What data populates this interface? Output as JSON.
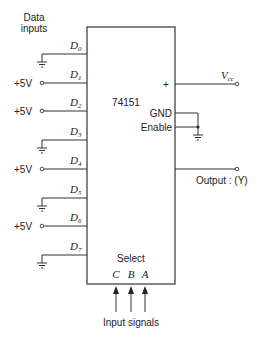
{
  "diagram": {
    "title_lines": [
      "Data",
      "inputs"
    ],
    "chip": {
      "part_number": "74151",
      "plus_label": "+",
      "gnd_label": "GND",
      "enable_label": "Enable",
      "select_label": "Select",
      "select_pins": [
        "C",
        "B",
        "A"
      ]
    },
    "data_inputs": [
      {
        "name": "D",
        "index": "0",
        "connection": "ground",
        "source_label": ""
      },
      {
        "name": "D",
        "index": "1",
        "connection": "+5V",
        "source_label": "+5V"
      },
      {
        "name": "D",
        "index": "2",
        "connection": "+5V",
        "source_label": "+5V"
      },
      {
        "name": "D",
        "index": "3",
        "connection": "ground",
        "source_label": ""
      },
      {
        "name": "D",
        "index": "4",
        "connection": "+5V",
        "source_label": "+5V"
      },
      {
        "name": "D",
        "index": "5",
        "connection": "ground",
        "source_label": ""
      },
      {
        "name": "D",
        "index": "6",
        "connection": "+5V",
        "source_label": "+5V"
      },
      {
        "name": "D",
        "index": "7",
        "connection": "ground",
        "source_label": ""
      }
    ],
    "vcc": {
      "main": "V",
      "sub": "cc"
    },
    "output_label": "Output : (Y)",
    "input_signals_label": "Input signals",
    "colors": {
      "line": "#333333",
      "text": "#222222",
      "background": "#ffffff"
    }
  }
}
